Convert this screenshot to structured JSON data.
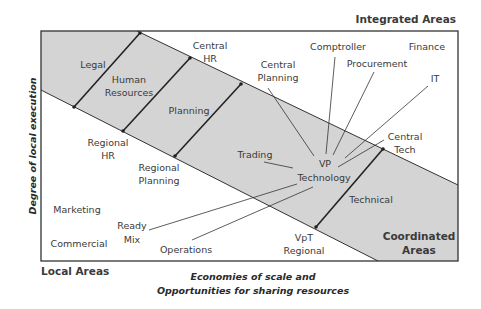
{
  "corners": {
    "top_right": "Integrated Areas",
    "bottom_left": "Local Areas",
    "bottom_right_line1": "Coordinated",
    "bottom_right_line2": "Areas"
  },
  "axes": {
    "y_label": "Degree of local execution",
    "x_label_line1": "Economies of scale and",
    "x_label_line2": "Opportunities for sharing resources"
  },
  "band_segments": [
    {
      "label": "Legal"
    },
    {
      "label_line1": "Human",
      "label_line2": "Resources"
    },
    {
      "label": "Planning"
    },
    {
      "label": "Technical"
    }
  ],
  "hub": {
    "line1": "VP",
    "line2": "Technology"
  },
  "integrated_labels": {
    "central_hr": {
      "line1": "Central",
      "line2": "HR"
    },
    "central_planning": {
      "line1": "Central",
      "line2": "Planning"
    },
    "comptroller": "Comptroller",
    "procurement": "Procurement",
    "finance": "Finance",
    "it": "IT",
    "central_tech": {
      "line1": "Central",
      "line2": "Tech"
    }
  },
  "band_labels": {
    "trading": "Trading"
  },
  "local_labels": {
    "regional_hr": {
      "line1": "Regional",
      "line2": "HR"
    },
    "regional_planning": {
      "line1": "Regional",
      "line2": "Planning"
    },
    "marketing": "Marketing",
    "commercial": "Commercial",
    "ready_mix": {
      "line1": "Ready",
      "line2": "Mix"
    },
    "operations": "Operations",
    "vpt_regional": {
      "line1": "VpT",
      "line2": "Regional"
    }
  },
  "colors": {
    "band_fill": "#d4d4d4",
    "border": "#333333",
    "text": "#3a3a3a"
  }
}
